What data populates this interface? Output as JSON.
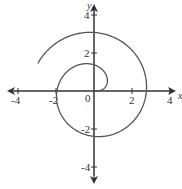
{
  "diagram": {
    "type": "polar-spiral",
    "axes": {
      "x_label": "x",
      "y_label": "y",
      "origin_label": "0",
      "x_ticks": [
        {
          "value": -4,
          "label": "-4"
        },
        {
          "value": -2,
          "label": "-2"
        },
        {
          "value": 2,
          "label": "2"
        },
        {
          "value": 4,
          "label": "4"
        }
      ],
      "y_ticks": [
        {
          "value": 4,
          "label": "4"
        },
        {
          "value": 2,
          "label": "2"
        },
        {
          "value": -2,
          "label": "-2"
        },
        {
          "value": -4,
          "label": "-4"
        }
      ],
      "range": [
        -4.5,
        4.5
      ]
    },
    "curve": {
      "description": "spiral starting at origin, winding counterclockwise outward",
      "theta_start": 0,
      "theta_end": 8.97,
      "color": "#555555"
    },
    "colors": {
      "axis": "#333333",
      "curve": "#555555",
      "background": "#ffffff"
    }
  }
}
